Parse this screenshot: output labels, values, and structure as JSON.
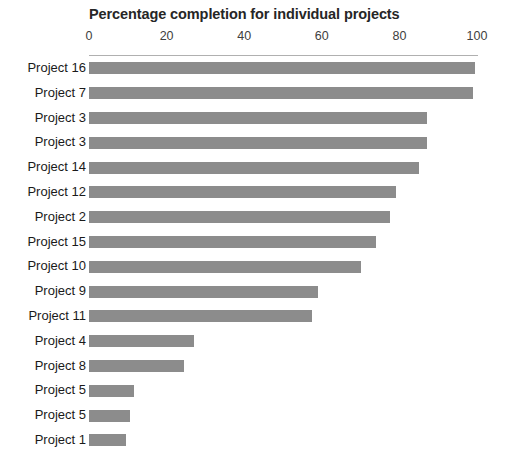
{
  "chart_data": {
    "type": "bar",
    "orientation": "horizontal",
    "title": "Percentage completion for individual projects",
    "xlabel": "",
    "ylabel": "",
    "xlim": [
      0,
      100
    ],
    "xticks": [
      0,
      20,
      40,
      60,
      80,
      100
    ],
    "xtick_labels": [
      "0",
      "20",
      "40",
      "60",
      "80",
      "100"
    ],
    "grid": false,
    "legend": false,
    "bar_color": "#8c8c8c",
    "axis_color": "#b0b0b0",
    "categories": [
      "Project 16",
      "Project 7",
      "Project 3",
      "Project 3",
      "Project 14",
      "Project 12",
      "Project 2",
      "Project 15",
      "Project 10",
      "Project 9",
      "Project 11",
      "Project 4",
      "Project 8",
      "Project 5",
      "Project 5",
      "Project 1"
    ],
    "values": [
      99.5,
      99,
      87,
      87,
      85,
      79,
      77.5,
      74,
      70,
      59,
      57.5,
      27,
      24.5,
      11.5,
      10.5,
      9.5
    ]
  }
}
